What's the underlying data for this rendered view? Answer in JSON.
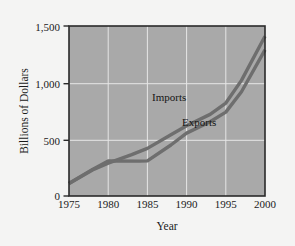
{
  "chart_data": {
    "type": "line",
    "title": "",
    "xlabel": "Year",
    "ylabel": "Billions of Dollars",
    "xlim": [
      1975,
      2000
    ],
    "ylim": [
      0,
      1500
    ],
    "grid": true,
    "legend_position": "inline-annotations",
    "plot_background": "#a9a9a9",
    "figure_background": "#f4f4f3",
    "gridline_color": "#e8e8e8",
    "axis_color": "#2a2a2a",
    "x_ticks": [
      1975,
      1980,
      1985,
      1990,
      1995,
      2000
    ],
    "x_tick_labels": [
      "1975",
      "1980",
      "1985",
      "1990",
      "1995",
      "2000"
    ],
    "y_ticks": [
      0,
      500,
      1000,
      1500
    ],
    "y_tick_labels": [
      "0",
      "500",
      "1,000",
      "1,500"
    ],
    "x": [
      1975,
      1980,
      1985,
      1990,
      1995,
      2000
    ],
    "series": [
      {
        "name": "Imports",
        "color": "#6e6e6e",
        "label": "Imports",
        "values": [
          110,
          290,
          420,
          620,
          820,
          1410
        ],
        "points": [
          {
            "x": 1975,
            "y": 110
          },
          {
            "x": 1978,
            "y": 230
          },
          {
            "x": 1980,
            "y": 290
          },
          {
            "x": 1983,
            "y": 365
          },
          {
            "x": 1985,
            "y": 420
          },
          {
            "x": 1988,
            "y": 540
          },
          {
            "x": 1990,
            "y": 620
          },
          {
            "x": 1993,
            "y": 720
          },
          {
            "x": 1995,
            "y": 820
          },
          {
            "x": 1997,
            "y": 1020
          },
          {
            "x": 2000,
            "y": 1410
          }
        ]
      },
      {
        "name": "Exports",
        "color": "#6e6e6e",
        "label": "Exports",
        "values": [
          110,
          310,
          310,
          555,
          740,
          1290
        ],
        "points": [
          {
            "x": 1975,
            "y": 110
          },
          {
            "x": 1978,
            "y": 235
          },
          {
            "x": 1980,
            "y": 310
          },
          {
            "x": 1984,
            "y": 308
          },
          {
            "x": 1985,
            "y": 310
          },
          {
            "x": 1988,
            "y": 450
          },
          {
            "x": 1990,
            "y": 555
          },
          {
            "x": 1993,
            "y": 655
          },
          {
            "x": 1995,
            "y": 740
          },
          {
            "x": 1997,
            "y": 920
          },
          {
            "x": 2000,
            "y": 1290
          }
        ]
      }
    ],
    "annotations": [
      {
        "text": "Imports",
        "x": 1990,
        "y": 880
      },
      {
        "text": "Exports",
        "x": 1994,
        "y": 690
      }
    ]
  },
  "axis": {
    "y_title": "Billions of Dollars",
    "x_title": "Year",
    "y_tick_0": "0",
    "y_tick_1": "500",
    "y_tick_2": "1,000",
    "y_tick_3": "1,500",
    "x_tick_0": "1975",
    "x_tick_1": "1980",
    "x_tick_2": "1985",
    "x_tick_3": "1990",
    "x_tick_4": "1995",
    "x_tick_5": "2000"
  },
  "labels": {
    "imports": "Imports",
    "exports": "Exports"
  }
}
